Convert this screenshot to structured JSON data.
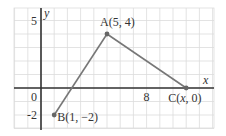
{
  "diagram": {
    "type": "coordinate-plane",
    "x_range": [
      -2,
      13
    ],
    "y_range": [
      -3,
      6
    ],
    "axis_labels": {
      "x": "x",
      "y": "y"
    },
    "tick_labels": {
      "x": [
        "0",
        "8"
      ],
      "y": [
        "5",
        "-2"
      ]
    },
    "tick_values": {
      "x": [
        0,
        8
      ],
      "y": [
        5,
        -2
      ]
    },
    "points": [
      {
        "id": "A",
        "x": 5,
        "y": 4,
        "label": "A(5, 4)"
      },
      {
        "id": "B",
        "x": 1,
        "y": -2,
        "label": "B(1, −2)"
      },
      {
        "id": "C",
        "x": 11,
        "y": 0,
        "label": "C(x, 0)"
      }
    ],
    "segments": [
      [
        "B",
        "A"
      ],
      [
        "A",
        "C"
      ]
    ],
    "colors": {
      "grid": "#dcdcdc",
      "axis": "#333333",
      "segment": "#777777",
      "point": "#666666"
    }
  }
}
